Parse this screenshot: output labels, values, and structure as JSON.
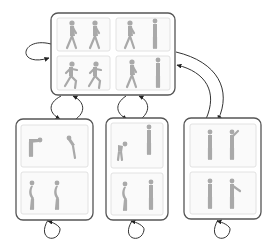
{
  "diagram": {
    "type": "state-transition-diagram",
    "colors": {
      "box_stroke": "#555555",
      "panel_fill": "#fafafa",
      "panel_stroke": "#e2e2e2",
      "figure_fill": "#a9a9a9",
      "edge_stroke": "#333333"
    },
    "nodes": [
      {
        "id": "top",
        "label": "walking/running",
        "panels": [
          {
            "row": 0,
            "col": 0,
            "figures": [
              "walking",
              "walking"
            ]
          },
          {
            "row": 0,
            "col": 1,
            "figures": [
              "walking",
              "standing-side"
            ]
          },
          {
            "row": 1,
            "col": 0,
            "figures": [
              "running",
              "running"
            ]
          },
          {
            "row": 1,
            "col": 1,
            "figures": [
              "walking",
              "standing-side"
            ]
          }
        ],
        "self_loop": "left"
      },
      {
        "id": "bottom-left",
        "label": "bending",
        "panels": [
          {
            "row": 0,
            "col": 0,
            "figures": [
              "bent-over",
              "bending"
            ]
          },
          {
            "row": 1,
            "col": 0,
            "figures": [
              "leaning",
              "leaning"
            ]
          }
        ],
        "self_loop": "bottom"
      },
      {
        "id": "bottom-middle",
        "label": "crouch/stand",
        "panels": [
          {
            "row": 0,
            "col": 0,
            "figures": [
              "crouching",
              "standing-tall"
            ]
          },
          {
            "row": 1,
            "col": 0,
            "figures": [
              "standing",
              "standing"
            ]
          }
        ],
        "self_loop": "bottom"
      },
      {
        "id": "bottom-right",
        "label": "standing/gesturing",
        "panels": [
          {
            "row": 0,
            "col": 0,
            "figures": [
              "standing",
              "arm-raised"
            ]
          },
          {
            "row": 1,
            "col": 0,
            "figures": [
              "standing",
              "arm-pointing"
            ]
          }
        ],
        "self_loop": "bottom"
      }
    ],
    "edges": [
      {
        "from": "top",
        "to": "top"
      },
      {
        "from": "top",
        "to": "bottom-left"
      },
      {
        "from": "bottom-left",
        "to": "top"
      },
      {
        "from": "top",
        "to": "bottom-middle"
      },
      {
        "from": "bottom-middle",
        "to": "top"
      },
      {
        "from": "top",
        "to": "bottom-right"
      },
      {
        "from": "bottom-right",
        "to": "top"
      },
      {
        "from": "bottom-left",
        "to": "bottom-left"
      },
      {
        "from": "bottom-middle",
        "to": "bottom-middle"
      },
      {
        "from": "bottom-right",
        "to": "bottom-right"
      }
    ]
  }
}
